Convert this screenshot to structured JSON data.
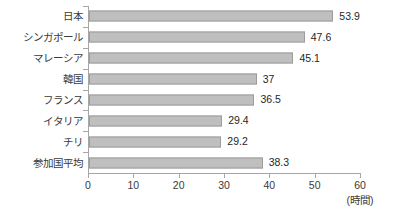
{
  "chart_data": {
    "type": "bar",
    "orientation": "horizontal",
    "title": "",
    "xlabel": "(時間)",
    "ylabel": "",
    "xlim": [
      0,
      60
    ],
    "xticks": [
      0,
      10,
      20,
      30,
      40,
      50,
      60
    ],
    "grid": false,
    "legend": null,
    "categories": [
      "日本",
      "シンガポール",
      "マレーシア",
      "韓国",
      "フランス",
      "イタリア",
      "チリ",
      "参加国平均"
    ],
    "values": [
      53.9,
      47.6,
      45.1,
      37,
      36.5,
      29.4,
      29.2,
      38.3
    ],
    "value_labels": [
      "53.9",
      "47.6",
      "45.1",
      "37",
      "36.5",
      "29.4",
      "29.2",
      "38.3"
    ],
    "colors": {
      "bar_fill": "#bfbfbf",
      "bar_border": "#9c9c9c",
      "axis": "#a6a6a6",
      "text": "#262626",
      "background": "#ffffff"
    }
  },
  "axis_unit_label": "(時間)"
}
